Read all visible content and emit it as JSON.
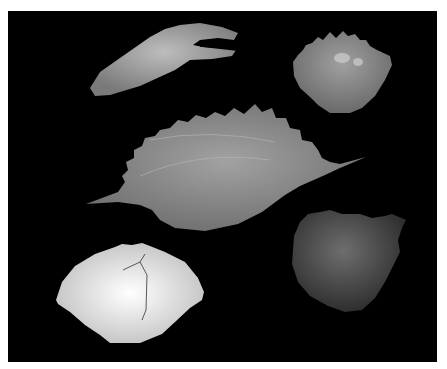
{
  "image": {
    "description": "Five fossil crab specimens on a black background",
    "background_color": "#000000",
    "border_color": "#ffffff",
    "specimens": [
      {
        "name": "claw",
        "color": "#a8a8a8"
      },
      {
        "name": "small-spiny-carapace",
        "color": "#8c8c8c"
      },
      {
        "name": "large-spined-carapace",
        "color": "#8e8e8e"
      },
      {
        "name": "smooth-white-carapace",
        "color": "#e6e6e6"
      },
      {
        "name": "rough-dark-carapace",
        "color": "#5a5a5a"
      }
    ]
  }
}
